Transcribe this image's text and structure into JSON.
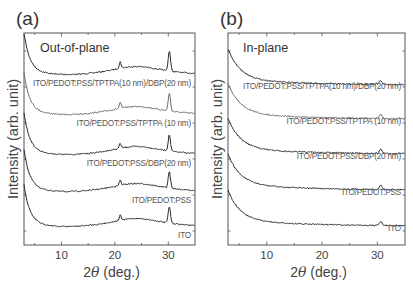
{
  "chart_data": [
    {
      "type": "line",
      "panel": "(a)",
      "title": "Out-of-plane",
      "xlabel": "2θ (deg.)",
      "ylabel": "Intensity (arb. unit)",
      "xlim": [
        3,
        35
      ],
      "xticks": [
        10,
        20,
        30
      ],
      "yticks_labeled": false,
      "grid": false,
      "legend": "inline labels under each curve",
      "series": [
        {
          "name": "ITO/PEDOT:PSS/TPTPA(10 nm)/DBP(20 nm)",
          "color": "#2a2a2a",
          "offset_rank": 5,
          "peaks_deg": [
            21.0,
            30.2
          ],
          "note": "strongest 30.2° peak"
        },
        {
          "name": "ITO/PEDOT:PSS/TPTPA (10 nm)",
          "color": "#6a6a6a",
          "offset_rank": 4,
          "peaks_deg": [
            21.0,
            30.2
          ]
        },
        {
          "name": "ITO/PEDOT:PSS/DBP(20 nm)",
          "color": "#2a2a2a",
          "offset_rank": 3,
          "peaks_deg": [
            21.0,
            30.2
          ]
        },
        {
          "name": "ITO/PEDOT:PSS",
          "color": "#2a2a2a",
          "offset_rank": 2,
          "peaks_deg": [
            21.0,
            30.2
          ]
        },
        {
          "name": "ITO",
          "color": "#2a2a2a",
          "offset_rank": 1,
          "peaks_deg": [
            21.0,
            30.2
          ]
        }
      ]
    },
    {
      "type": "line",
      "panel": "(b)",
      "title": "In-plane",
      "xlabel": "2θ (deg.)",
      "ylabel": "Intensity (arb. unit)",
      "xlim": [
        3,
        35
      ],
      "xticks": [
        10,
        20,
        30
      ],
      "yticks_labeled": false,
      "grid": false,
      "legend": "inline labels under each curve",
      "series": [
        {
          "name": "ITO/PEDOT:PSS/TPTPA(10 nm)/DBP(20 nm)",
          "color": "#2a2a2a",
          "offset_rank": 5,
          "peaks_deg": [
            30.6
          ]
        },
        {
          "name": "ITO/PEDOT:PSS/TPTPA (10 nm)",
          "color": "#6a6a6a",
          "offset_rank": 4,
          "peaks_deg": [
            30.6
          ]
        },
        {
          "name": "ITO/PEDOT:PSS/DBP(20 nm)",
          "color": "#2a2a2a",
          "offset_rank": 3,
          "peaks_deg": [
            30.6
          ]
        },
        {
          "name": "ITO/PEDOT:PSS",
          "color": "#2a2a2a",
          "offset_rank": 2,
          "peaks_deg": [
            30.6
          ]
        },
        {
          "name": "ITO",
          "color": "#2a2a2a",
          "offset_rank": 1,
          "peaks_deg": [
            30.6
          ]
        }
      ]
    }
  ],
  "figure": {
    "panels": [
      {
        "id": "a",
        "label": "(a)",
        "mode": "Out-of-plane",
        "frame": {
          "x0": 24,
          "x1": 195,
          "y0": 33,
          "y1": 245
        },
        "label_pos": [
          16,
          25
        ],
        "mode_pos": [
          40,
          52
        ],
        "baselines": [
          72,
          112,
          152,
          189,
          224
        ],
        "label_y": [
          86,
          126,
          166,
          203,
          238
        ],
        "colors": [
          "#2a2a2a",
          "#6a6a6a",
          "#2a2a2a",
          "#2a2a2a",
          "#2a2a2a"
        ],
        "labels": [
          "ITO/PEDOT:PSS/TPTPA(10 nm)/DBP(20 nm)",
          "ITO/PEDOT:PSS/TPTPA (10 nm)",
          "ITO/PEDOT:PSS/DBP(20 nm)",
          "ITO/PEDOT:PSS",
          "ITO"
        ],
        "kind": "oop"
      },
      {
        "id": "b",
        "label": "(b)",
        "mode": "In-plane",
        "frame": {
          "x0": 228,
          "x1": 405,
          "y0": 33,
          "y1": 245
        },
        "label_pos": [
          220,
          25
        ],
        "mode_pos": [
          243,
          52
        ],
        "baselines": [
          79,
          113,
          148,
          184,
          220
        ],
        "label_y": [
          89,
          124,
          159,
          195,
          231
        ],
        "colors": [
          "#2a2a2a",
          "#6a6a6a",
          "#2a2a2a",
          "#2a2a2a",
          "#2a2a2a"
        ],
        "labels": [
          "ITO/PEDOT:PSS/TPTPA(10 nm)/DBP(20 nm)",
          "ITO/PEDOT:PSS/TPTPA (10 nm)",
          "ITO/PEDOT:PSS/DBP(20 nm)",
          "ITO/PEDOT:PSS",
          "ITO"
        ],
        "kind": "ip"
      }
    ],
    "x_tick_labels": [
      "10",
      "20",
      "30"
    ],
    "xlabel_main": "2",
    "xlabel_theta": "θ",
    "xlabel_unit": " (deg.)",
    "ylabel": "Intensity (arb. unit)"
  }
}
